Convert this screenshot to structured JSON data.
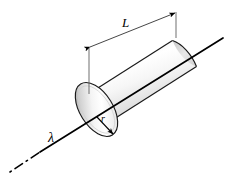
{
  "figure": {
    "background_color": "#ffffff",
    "stroke_color": "#000000",
    "shape": {
      "name": "cylinder",
      "fill_light": "#ffffff",
      "fill_mid": "#d8d8d8",
      "fill_dark": "#9a9a9a",
      "end_cap_fill_light": "#ffffff",
      "end_cap_fill_dark": "#b4b4b4"
    },
    "labels": {
      "length": "L",
      "radius": "r",
      "linear_charge_density": "λ"
    },
    "annotations": {
      "length_dimension": {
        "label": "L",
        "style": "double-headed-arrow",
        "extension_lines": 2
      },
      "radius_dimension": {
        "label": "r",
        "style": "single-headed-arrow",
        "from": "axis-center",
        "to": "cap-edge"
      },
      "axis_line": {
        "label": "λ",
        "style": "solid-with-dashed-tail",
        "direction": "lower-left-to-upper-right"
      }
    }
  }
}
